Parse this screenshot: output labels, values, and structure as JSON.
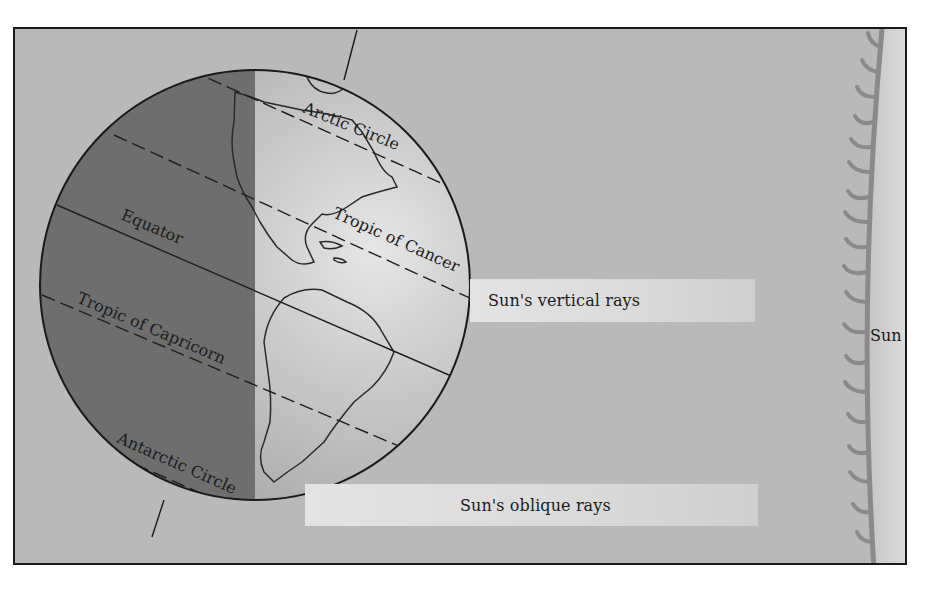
{
  "diagram": {
    "title": "",
    "labels": {
      "arctic_circle": "Arctic Circle",
      "tropic_of_cancer": "Tropic of Cancer",
      "equator": "Equator",
      "tropic_of_capricorn": "Tropic of Capricorn",
      "antarctic_circle": "Antarctic Circle",
      "sun_vertical_rays": "Sun's vertical rays",
      "sun_oblique_rays": "Sun's oblique rays",
      "sun": "Sun"
    },
    "colors": {
      "background": "#b9b9b9",
      "globe_night_side": "#6e6e6e",
      "globe_day_side": "#c8c8c8",
      "sun_surface": "#d2d2d2",
      "sun_flares": "#8c8c8c",
      "ray_band": "#dedede",
      "frame_border": "#1a1a1a"
    }
  }
}
